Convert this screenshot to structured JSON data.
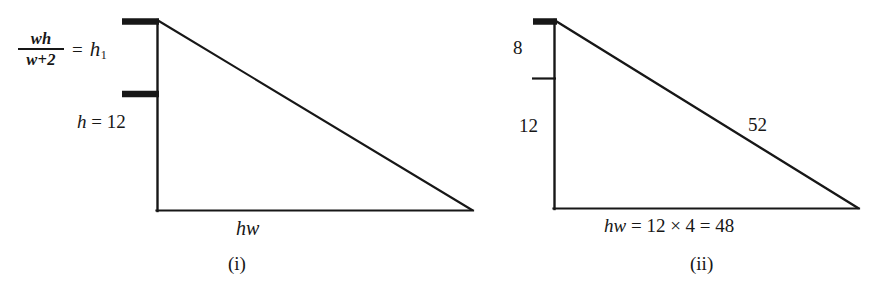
{
  "figure": {
    "background_color": "#ffffff",
    "stroke_color": "#171717",
    "width": 886,
    "height": 297,
    "panels": [
      {
        "caption": "(i)",
        "kind": "right-triangle-diagram",
        "labels": {
          "fraction_numerator": "wh",
          "fraction_denominator": "w+2",
          "fraction_equals": "=",
          "fraction_result": "h",
          "fraction_result_subscript": "1",
          "height_label": "h = 12",
          "height_label_variable": "h",
          "height_label_rest": " = 12",
          "base_label": "hw"
        },
        "geometry": {
          "apex_top": [
            157,
            20
          ],
          "right_angle": [
            157,
            211
          ],
          "apex_right": [
            472,
            211
          ],
          "tick_marks": [
            {
              "y": 21,
              "x1": 122,
              "x2": 158,
              "thickness": 6
            },
            {
              "y": 94,
              "x1": 122,
              "x2": 158,
              "thickness": 6
            }
          ]
        }
      },
      {
        "caption": "(ii)",
        "kind": "right-triangle-diagram",
        "labels": {
          "upper_segment": "8",
          "lower_segment": "12",
          "hypotenuse": "52",
          "base_label": "hw = 12 × 4 = 48",
          "base_label_variable": "hw",
          "base_label_rest": " = 12 × 4 = 48"
        },
        "geometry": {
          "apex_top": [
            554,
            20
          ],
          "right_angle": [
            554,
            209
          ],
          "apex_right": [
            858,
            209
          ],
          "tick_marks": [
            {
              "y": 21,
              "x1": 533,
              "x2": 556,
              "thickness": 6
            },
            {
              "y": 78,
              "x1": 533,
              "x2": 556,
              "thickness": 2
            }
          ]
        }
      }
    ]
  }
}
